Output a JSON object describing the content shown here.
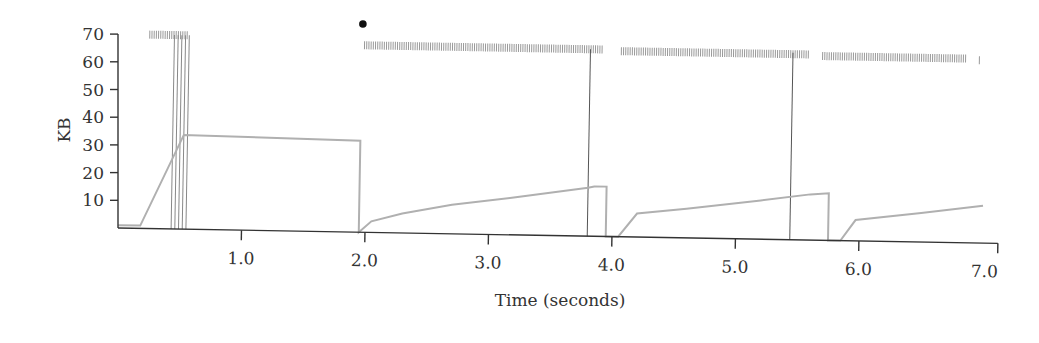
{
  "chart_data": {
    "type": "line",
    "title": "",
    "xlabel": "Time (seconds)",
    "ylabel": "KB",
    "xlim": [
      0.0,
      7.0
    ],
    "ylim": [
      0,
      70
    ],
    "grid": false,
    "legend": null,
    "x_ticks": [
      "1.0",
      "2.0",
      "3.0",
      "4.0",
      "5.0",
      "6.0",
      "7.0"
    ],
    "y_ticks": [
      "10",
      "20",
      "30",
      "40",
      "50",
      "60",
      "70"
    ],
    "series": [
      {
        "name": "congestion-window",
        "color": "#aaaaaa",
        "points": [
          [
            0.0,
            1
          ],
          [
            0.18,
            1
          ],
          [
            0.52,
            34
          ],
          [
            1.95,
            33
          ],
          [
            1.95,
            0
          ],
          [
            2.05,
            4
          ],
          [
            2.3,
            7
          ],
          [
            2.7,
            10.5
          ],
          [
            3.2,
            13.5
          ],
          [
            3.8,
            17.5
          ],
          [
            3.85,
            18
          ],
          [
            3.95,
            18
          ],
          [
            3.95,
            0
          ],
          [
            4.05,
            0
          ],
          [
            4.2,
            8.5
          ],
          [
            4.6,
            10.5
          ],
          [
            5.2,
            14
          ],
          [
            5.6,
            16.5
          ],
          [
            5.75,
            17
          ],
          [
            5.75,
            0
          ],
          [
            5.85,
            0
          ],
          [
            5.97,
            7.5
          ],
          [
            6.5,
            10.5
          ],
          [
            7.0,
            13.5
          ]
        ]
      }
    ],
    "timeout_lines_x": [
      0.43,
      0.46,
      0.49,
      0.52,
      0.55,
      3.8,
      5.44
    ],
    "packet_send_marks": [
      {
        "start": 0.23,
        "end": 0.55,
        "y": 70
      },
      {
        "start": 1.97,
        "end": 3.9,
        "y": 67.5
      },
      {
        "start": 4.05,
        "end": 5.58,
        "y": 67
      },
      {
        "start": 5.68,
        "end": 6.85,
        "y": 66.5
      },
      {
        "start": 6.95,
        "end": 6.96,
        "y": 66
      }
    ],
    "markers": [
      {
        "x": 1.97,
        "y": 73,
        "shape": "dot"
      }
    ]
  }
}
